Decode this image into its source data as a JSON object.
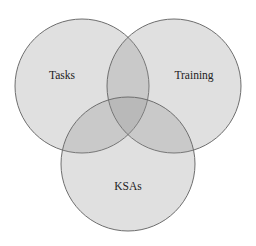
{
  "diagram": {
    "type": "venn",
    "sets": [
      {
        "id": "tasks",
        "label": "Tasks",
        "cx": 82,
        "cy": 86,
        "r": 67,
        "label_x": 62,
        "label_y": 79
      },
      {
        "id": "training",
        "label": "Training",
        "cx": 174,
        "cy": 86,
        "r": 67,
        "label_x": 194,
        "label_y": 79
      },
      {
        "id": "ksas",
        "label": "KSAs",
        "cx": 128,
        "cy": 164,
        "r": 67,
        "label_x": 128,
        "label_y": 190
      }
    ],
    "colors": {
      "fill": "#8e8e8e",
      "stroke": "#6e6e6e",
      "text": "#222222",
      "background": "#ffffff"
    }
  }
}
